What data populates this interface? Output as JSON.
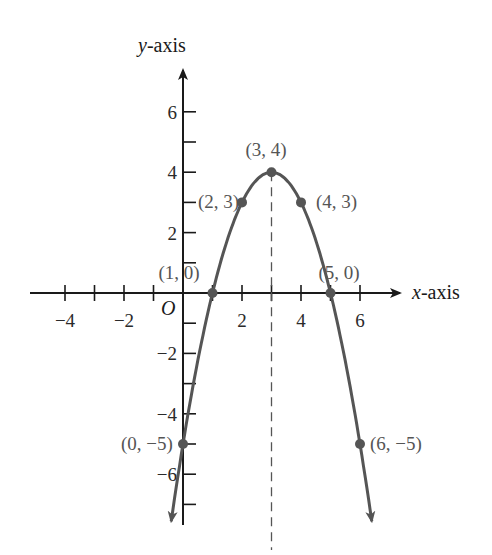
{
  "chart_data": {
    "type": "line",
    "title": "",
    "function": "y = -(x - 3)^2 + 4",
    "xlabel": "x-axis",
    "ylabel": "y-axis",
    "origin_label": "O",
    "xlim": [
      -5,
      7
    ],
    "ylim": [
      -8,
      7.5
    ],
    "grid": false,
    "x_ticks": [
      -4,
      -3,
      -2,
      -1,
      1,
      2,
      3,
      4,
      5,
      6
    ],
    "x_tick_labels": [
      "−4",
      "−2",
      "2",
      "4",
      "6"
    ],
    "x_tick_label_values": [
      -4,
      -2,
      2,
      4,
      6
    ],
    "y_ticks": [
      -7,
      -6,
      -5,
      -4,
      -3,
      -2,
      -1,
      1,
      2,
      3,
      4,
      5,
      6
    ],
    "y_tick_labels": [
      "6",
      "4",
      "2",
      "−2",
      "−4",
      "−6"
    ],
    "y_tick_label_values": [
      6,
      4,
      2,
      -2,
      -4,
      -6
    ],
    "axis_of_symmetry": {
      "x": 3,
      "style": "dashed"
    },
    "points": [
      {
        "x": 0,
        "y": -5,
        "label": "(0, −5)"
      },
      {
        "x": 1,
        "y": 0,
        "label": "(1, 0)"
      },
      {
        "x": 2,
        "y": 3,
        "label": "(2, 3)"
      },
      {
        "x": 3,
        "y": 4,
        "label": "(3, 4)"
      },
      {
        "x": 4,
        "y": 3,
        "label": "(4, 3)"
      },
      {
        "x": 5,
        "y": 0,
        "label": "(5, 0)"
      },
      {
        "x": 6,
        "y": -5,
        "label": "(6, −5)"
      }
    ],
    "curve_color": "#555555",
    "axis_color": "#1a1a1a"
  },
  "labels": {
    "x_axis_var": "x",
    "x_axis_suffix": "-axis",
    "y_axis_var": "y",
    "y_axis_suffix": "-axis",
    "origin": "O"
  }
}
